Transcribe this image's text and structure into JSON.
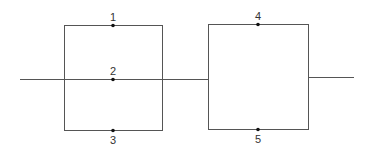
{
  "diagram": {
    "type": "series-parallel network",
    "blocks": [
      {
        "name": "left-block",
        "x": 64,
        "y": 25,
        "w": 98,
        "h": 105,
        "branches": 3
      },
      {
        "name": "right-block",
        "x": 208,
        "y": 24,
        "w": 100,
        "h": 105,
        "branches": 2
      }
    ],
    "nodes": [
      {
        "label": "1",
        "x": 113,
        "y": 25,
        "label_pos": "above"
      },
      {
        "label": "2",
        "x": 113,
        "y": 79,
        "label_pos": "above"
      },
      {
        "label": "3",
        "x": 113,
        "y": 130,
        "label_pos": "below"
      },
      {
        "label": "4",
        "x": 258,
        "y": 24,
        "label_pos": "above"
      },
      {
        "label": "5",
        "x": 258,
        "y": 129,
        "label_pos": "below"
      }
    ],
    "colors": {
      "line": "#555555",
      "dot": "#111111",
      "text": "#333333"
    }
  }
}
